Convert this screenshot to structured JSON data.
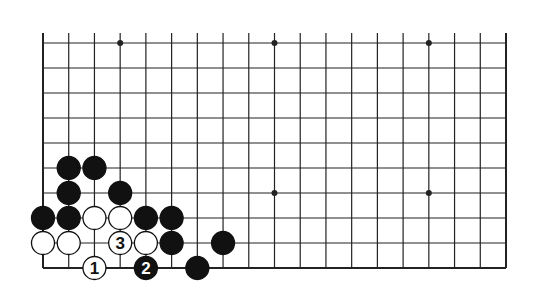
{
  "diagram": {
    "type": "go-board",
    "board_size": 19,
    "visible_rows": 10,
    "edges_shown": [
      "left",
      "right",
      "bottom"
    ],
    "colors": {
      "line": "#222222",
      "black": "#111111",
      "white": "#ffffff",
      "background": "#ffffff"
    },
    "star_points": [
      {
        "col": 4,
        "row": 10
      },
      {
        "col": 10,
        "row": 10
      },
      {
        "col": 16,
        "row": 10
      },
      {
        "col": 10,
        "row": 4
      },
      {
        "col": 16,
        "row": 4
      }
    ],
    "stones": [
      {
        "color": "black",
        "col": 2,
        "row": 5,
        "label": ""
      },
      {
        "color": "black",
        "col": 3,
        "row": 5,
        "label": ""
      },
      {
        "color": "black",
        "col": 2,
        "row": 4,
        "label": ""
      },
      {
        "color": "black",
        "col": 4,
        "row": 4,
        "label": ""
      },
      {
        "color": "black",
        "col": 1,
        "row": 3,
        "label": ""
      },
      {
        "color": "black",
        "col": 2,
        "row": 3,
        "label": ""
      },
      {
        "color": "white",
        "col": 3,
        "row": 3,
        "label": ""
      },
      {
        "color": "white",
        "col": 4,
        "row": 3,
        "label": ""
      },
      {
        "color": "black",
        "col": 5,
        "row": 3,
        "label": ""
      },
      {
        "color": "black",
        "col": 6,
        "row": 3,
        "label": ""
      },
      {
        "color": "white",
        "col": 1,
        "row": 2,
        "label": ""
      },
      {
        "color": "white",
        "col": 2,
        "row": 2,
        "label": ""
      },
      {
        "color": "white",
        "col": 4,
        "row": 2,
        "label": "3"
      },
      {
        "color": "white",
        "col": 5,
        "row": 2,
        "label": ""
      },
      {
        "color": "black",
        "col": 6,
        "row": 2,
        "label": ""
      },
      {
        "color": "black",
        "col": 8,
        "row": 2,
        "label": ""
      },
      {
        "color": "white",
        "col": 3,
        "row": 1,
        "label": "1"
      },
      {
        "color": "black",
        "col": 5,
        "row": 1,
        "label": "2"
      },
      {
        "color": "black",
        "col": 7,
        "row": 1,
        "label": ""
      }
    ]
  }
}
